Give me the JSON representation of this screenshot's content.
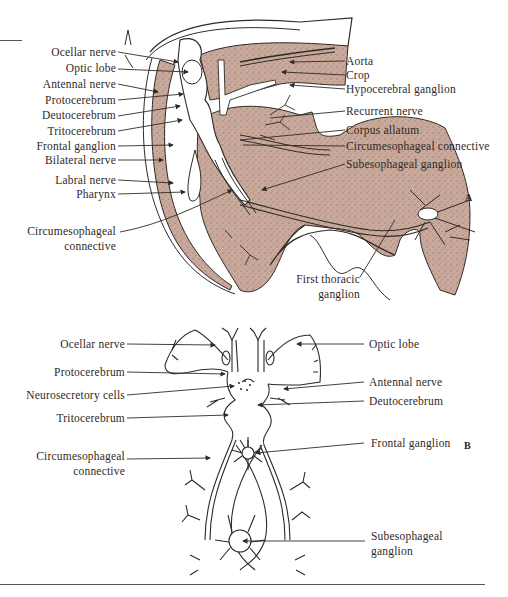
{
  "figure": {
    "panel_a": {
      "letter": "A",
      "left_labels": [
        "Ocellar nerve",
        "Optic lobe",
        "Antennal nerve",
        "Protocerebrum",
        "Deutocerebrum",
        "Tritocerebrum",
        "Frontal ganglion",
        "Bilateral nerve",
        "Labral nerve",
        "Pharynx"
      ],
      "left_bottom_label": [
        "Circumesophageal",
        "connective"
      ],
      "right_labels": [
        "Aorta",
        "Crop",
        "Hypocerebral ganglion",
        "Recurrent nerve",
        "Corpus allatum",
        "Circumesophageal connective",
        "Subesophageal ganglion"
      ],
      "bottom_label": [
        "First thoracic",
        "ganglion"
      ]
    },
    "panel_b": {
      "letter": "B",
      "left_labels": [
        "Ocellar nerve",
        "Protocerebrum",
        "Neurosecretory cells",
        "Tritocerebrum"
      ],
      "left_bottom_label": [
        "Circumesophageal",
        "connective"
      ],
      "right_labels": [
        "Optic lobe",
        "Antennal nerve",
        "Deutocerebrum",
        "Frontal ganglion"
      ],
      "bottom_right_label": [
        "Subesophageal",
        "ganglion"
      ]
    },
    "colors": {
      "tissue_fill": "#c9a99b",
      "line": "#2f2a28",
      "background": "#ffffff"
    }
  }
}
